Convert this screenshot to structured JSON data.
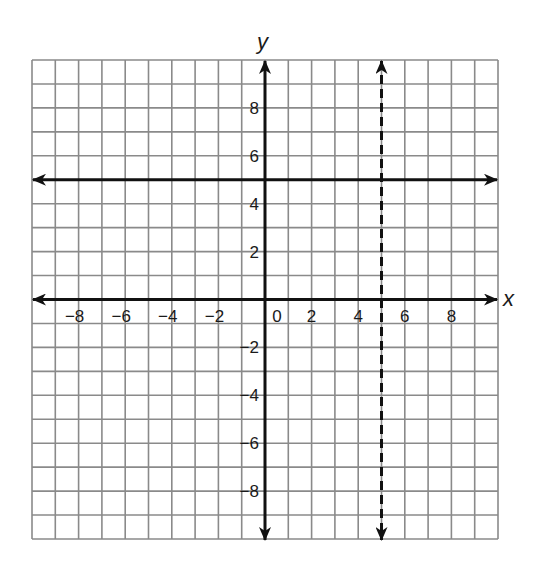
{
  "chart_data": {
    "type": "line",
    "title": "",
    "xlabel": "x",
    "ylabel": "y",
    "xlim": [
      -10,
      10
    ],
    "ylim": [
      -10,
      10
    ],
    "grid": true,
    "grid_step": 1,
    "x_tick_labels": [
      {
        "value": -8,
        "label": "−8"
      },
      {
        "value": -6,
        "label": "−6"
      },
      {
        "value": -4,
        "label": "−4"
      },
      {
        "value": -2,
        "label": "−2"
      },
      {
        "value": 0,
        "label": "0"
      },
      {
        "value": 2,
        "label": "2"
      },
      {
        "value": 4,
        "label": "4"
      },
      {
        "value": 6,
        "label": "6"
      },
      {
        "value": 8,
        "label": "8"
      }
    ],
    "y_tick_labels": [
      {
        "value": 8,
        "label": "8"
      },
      {
        "value": 6,
        "label": "6"
      },
      {
        "value": 4,
        "label": "4"
      },
      {
        "value": 2,
        "label": "2"
      },
      {
        "value": -2,
        "label": "−2"
      },
      {
        "value": -4,
        "label": "−4"
      },
      {
        "value": -6,
        "label": "−6"
      },
      {
        "value": -8,
        "label": "−8"
      }
    ],
    "series": [
      {
        "name": "y = 5",
        "kind": "horizontal",
        "value": 5,
        "style": "solid",
        "arrows": "both"
      },
      {
        "name": "x = 5",
        "kind": "vertical",
        "value": 5,
        "style": "dashed",
        "arrows": "both"
      }
    ],
    "legend": "none"
  },
  "colors": {
    "grid": "#8a8a8a",
    "axis": "#111111",
    "line": "#111111"
  }
}
